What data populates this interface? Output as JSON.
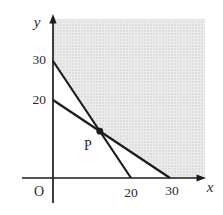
{
  "figure": {
    "background": "#ffffff",
    "line_color": "#1c1c1c",
    "shade_base_color": "#ececec",
    "shade_dot_color": "#c9c9c9",
    "labels": {
      "y_axis": "y",
      "x_axis": "x",
      "origin": "O",
      "point": "P",
      "y_tick_30": "30",
      "y_tick_20": "20",
      "x_tick_20": "20",
      "x_tick_30": "30"
    }
  },
  "chart_data": {
    "type": "line",
    "title": "",
    "xlabel": "x",
    "ylabel": "y",
    "x_ticks": [
      20,
      30
    ],
    "y_ticks": [
      20,
      30
    ],
    "xlim": [
      0,
      39
    ],
    "ylim": [
      0,
      41
    ],
    "grid": false,
    "legend": null,
    "series": [
      {
        "name": "steeper-line",
        "points": [
          [
            0,
            30
          ],
          [
            20,
            0
          ]
        ]
      },
      {
        "name": "shallower-line",
        "points": [
          [
            0,
            20
          ],
          [
            30,
            0
          ]
        ]
      }
    ],
    "intersection_point": {
      "label": "P",
      "x": 12,
      "y": 12
    },
    "shaded_region": "halftone-gray region above both lines: y >= 30 - 1.5x and y >= 20 - (2/3)x, clipped by figure top and right edges"
  }
}
